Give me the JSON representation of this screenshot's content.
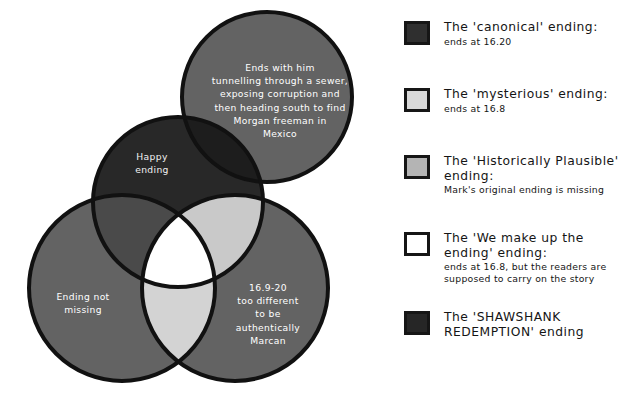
{
  "figure": {
    "type": "venn-diagram",
    "background_color": "#ffffff"
  },
  "venn": {
    "regions": [
      {
        "name": "shawshank-circle",
        "label": "Ends with him\ntunnelling through a sewer,\nexposing corruption and\nthen heading south to find\nMorgan freeman in\nMexico",
        "fill": "#636363"
      },
      {
        "name": "canonical-circle",
        "label": "Happy\nending",
        "fill": "#282828"
      },
      {
        "name": "historically-plausible-circle",
        "label": "Ending not\nmissing",
        "fill": "#636363"
      },
      {
        "name": "mysterious-circle",
        "label": "16.9-20\ntoo different\nto be\nauthentically\nMarcan",
        "fill": "#636363"
      }
    ],
    "labels": {
      "shawshank": "Ends with him\ntunnelling through a sewer,\nexposing corruption and\nthen heading south to find\nMorgan freeman in\nMexico",
      "happy_ending": "Happy\nending",
      "ending_not_missing": "Ending not\nmissing",
      "too_different": "16.9-20\ntoo different\nto be\nauthentically\nMarcan"
    },
    "colors": {
      "outline": "#111111",
      "base_gray": "#636363",
      "dark": "#282828",
      "darkest": "#1d1d1d",
      "light_gray": "#c9c9c9",
      "lighter_gray": "#d5d5d5",
      "white": "#ffffff"
    }
  },
  "legend": {
    "items": [
      {
        "name": "canonical",
        "swatch_color": "#2f2f2f",
        "title": "The 'canonical' ending:",
        "subtitle": "ends at 16.20"
      },
      {
        "name": "mysterious",
        "swatch_color": "#d9d9d9",
        "title": "The 'mysterious' ending:",
        "subtitle": "ends at 16.8"
      },
      {
        "name": "historically-plausible",
        "swatch_color": "#b4b4b4",
        "title": "The 'Historically Plausible'\nending:",
        "subtitle": "Mark's original ending is missing"
      },
      {
        "name": "we-make-up-the-ending",
        "swatch_color": "#ffffff",
        "title": "The 'We make up the\nending' ending:",
        "subtitle": "ends at 16.8, but the readers are\nsupposed to carry on the story"
      },
      {
        "name": "shawshank-redemption",
        "swatch_color": "#262626",
        "title": "The 'SHAWSHANK\nREDEMPTION' ending",
        "subtitle": ""
      }
    ]
  }
}
